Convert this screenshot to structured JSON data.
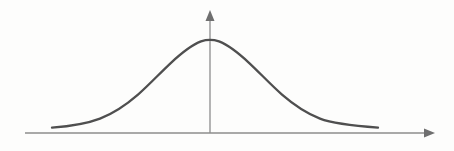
{
  "figure": {
    "kind": "diagram",
    "title": "",
    "background_color": "#fdfdfc",
    "width": 454,
    "height": 151
  },
  "axes": {
    "horizontal": {
      "name": "x-axis",
      "color": "#8d8d8d",
      "stroke_width": 1.3,
      "x_start": 25,
      "x_end": 425,
      "y": 133,
      "arrowhead": {
        "name": "x-axis-arrowhead",
        "direction": "right",
        "tip_x": 435,
        "tip_y": 133,
        "length": 11,
        "half_height": 4.5,
        "color": "#6f6f6f"
      }
    },
    "vertical": {
      "name": "y-axis",
      "color": "#8d8d8d",
      "stroke_width": 1.3,
      "x": 210,
      "y_start": 133,
      "y_end": 20,
      "arrowhead": {
        "name": "y-axis-arrowhead",
        "direction": "up",
        "tip_x": 210,
        "tip_y": 10,
        "length": 11,
        "half_width": 4.5,
        "color": "#6f6f6f"
      }
    }
  },
  "curve": {
    "name": "bell-curve",
    "type": "gaussian",
    "color": "#4f4f4f",
    "stroke_width": 2.3,
    "peak_x": 210,
    "peak_y": 40,
    "baseline_y": 133,
    "left_end_x": 52,
    "right_end_x": 378,
    "path": "M 52,127.6 C 73,126.0 88,123.2 100,118.6 C 114,113.2 126,105.0 138,94.6 C 150,84.0 160,73.0 171,62.8 C 182,52.6 192,44.8 201,41.4 C 206,39.8 214,39.8 219,41.4 C 228,44.8 238,52.6 249,62.8 C 260,73.0 270,84.0 282,94.6 C 294,105.0 306,113.2 320,118.6 C 332,123.2 357,126.0 378,127.6"
  },
  "chart_data": {
    "type": "line",
    "title": "",
    "xlabel": "",
    "ylabel": "",
    "legend": [],
    "grid": false,
    "x": [
      -3.0,
      -2.5,
      -2.0,
      -1.5,
      -1.0,
      -0.5,
      0.0,
      0.5,
      1.0,
      1.5,
      2.0,
      2.5,
      3.0
    ],
    "series": [
      {
        "name": "normal-density",
        "values": [
          0.06,
          0.14,
          0.28,
          0.49,
          0.72,
          0.92,
          1.0,
          0.92,
          0.72,
          0.49,
          0.28,
          0.14,
          0.06
        ]
      }
    ],
    "xlim": [
      -3.2,
      3.2
    ],
    "ylim": [
      0,
      1.1
    ]
  }
}
